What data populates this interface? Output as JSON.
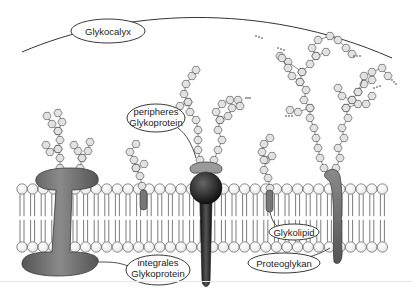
{
  "diagram": {
    "labels": {
      "glycocalyx": "Glykocalyx",
      "peripheral_line1": "peripheres",
      "peripheral_line2": "Glykoprotein",
      "integral_line1": "integrales",
      "integral_line2": "Glykoprotein",
      "glycolipid": "Glykolipid",
      "proteoglycan": "Proteoglykan"
    },
    "components": [
      {
        "name": "glycocalyx",
        "type": "outer-coat"
      },
      {
        "name": "peripheral-glycoprotein",
        "type": "protein",
        "attached": "outer-surface"
      },
      {
        "name": "integral-glycoprotein",
        "type": "transmembrane-protein"
      },
      {
        "name": "glycolipid",
        "type": "lipid"
      },
      {
        "name": "proteoglycan",
        "type": "transmembrane-protein"
      },
      {
        "name": "phospholipid-bilayer",
        "type": "membrane"
      }
    ],
    "colors": {
      "protein_gray": "#6b6b6b",
      "protein_dark": "#2a2a2a",
      "sugar_fill": "#e2e2e2",
      "line": "#333333"
    }
  }
}
